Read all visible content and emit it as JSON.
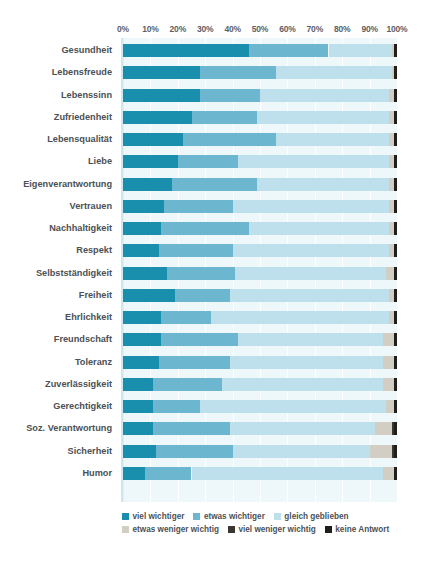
{
  "chart_data": {
    "type": "bar",
    "subtype": "horizontal-stacked-100",
    "title": "",
    "subtitle": "",
    "xlabel": "",
    "ylabel": "",
    "xlim": [
      0,
      100
    ],
    "grid": true,
    "legend_position": "bottom",
    "x_ticks": [
      0,
      10,
      20,
      30,
      40,
      50,
      60,
      70,
      80,
      90,
      100
    ],
    "x_tick_labels": [
      "0%",
      "10%",
      "20%",
      "30%",
      "40%",
      "50%",
      "60%",
      "70%",
      "80%",
      "90%",
      "100%"
    ],
    "categories": [
      "Gesundheit",
      "Lebensfreude",
      "Lebenssinn",
      "Zufriedenheit",
      "Lebensqualität",
      "Liebe",
      "Eigenverantwortung",
      "Vertrauen",
      "Nachhaltigkeit",
      "Respekt",
      "Selbstständigkeit",
      "Freiheit",
      "Ehrlichkeit",
      "Freundschaft",
      "Toleranz",
      "Zuverlässigkeit",
      "Gerechtigkeit",
      "Soz. Verantwortung",
      "Sicherheit",
      "Humor"
    ],
    "series": [
      {
        "name": "viel wichtiger",
        "color": "#1a8fad",
        "values": [
          46,
          28,
          28,
          25,
          22,
          20,
          18,
          15,
          14,
          13,
          16,
          19,
          14,
          14,
          13,
          11,
          11,
          11,
          12,
          8
        ]
      },
      {
        "name": "etwas wichtiger",
        "color": "#6cb6cf",
        "values": [
          29,
          28,
          22,
          24,
          34,
          22,
          31,
          25,
          32,
          27,
          25,
          20,
          18,
          28,
          26,
          25,
          17,
          28,
          28,
          17
        ]
      },
      {
        "name": "gleich geblieben",
        "color": "#bde0ec",
        "values": [
          23,
          42,
          47,
          48,
          41,
          55,
          48,
          57,
          51,
          57,
          55,
          58,
          65,
          53,
          56,
          59,
          68,
          53,
          50,
          70
        ]
      },
      {
        "name": "etwas weniger wichtig",
        "color": "#d3cec4",
        "values": [
          1,
          1,
          2,
          2,
          2,
          2,
          2,
          2,
          2,
          2,
          3,
          2,
          2,
          4,
          4,
          4,
          3,
          6,
          8,
          4
        ]
      },
      {
        "name": "viel weniger wichtig",
        "color": "#3b3630",
        "values": [
          0,
          0,
          0,
          0,
          0,
          0,
          0,
          0,
          0,
          0,
          0,
          0,
          0,
          0,
          0,
          0,
          0,
          1,
          1,
          0
        ]
      },
      {
        "name": "keine Antwort",
        "color": "#211f1c",
        "values": [
          1,
          1,
          1,
          1,
          1,
          1,
          1,
          1,
          1,
          1,
          1,
          1,
          1,
          1,
          1,
          1,
          1,
          1,
          1,
          1
        ]
      }
    ]
  },
  "legend": {
    "rows": [
      [
        {
          "label": "viel wichtiger",
          "color": "#1a8fad"
        },
        {
          "label": "etwas wichtiger",
          "color": "#6cb6cf"
        },
        {
          "label": "gleich geblieben",
          "color": "#bde0ec"
        }
      ],
      [
        {
          "label": "etwas weniger wichtig",
          "color": "#d3cec4"
        },
        {
          "label": "viel weniger wichtig",
          "color": "#3b3630"
        },
        {
          "label": "keine Antwort",
          "color": "#211f1c"
        }
      ]
    ]
  },
  "style": {
    "plot_background": "#eef7fa",
    "gridline_color": "#ffffff",
    "axis_text_color": "#5d6166",
    "category_text_color": "#4c5155"
  }
}
